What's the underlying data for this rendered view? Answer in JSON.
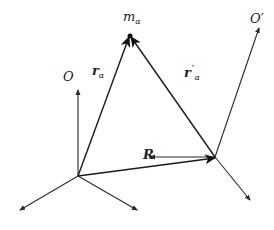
{
  "diagram": {
    "type": "vector-reference-frames",
    "colors": {
      "line": "#2a2a2a",
      "background": "#ffffff"
    },
    "labels": {
      "origin_O": "O",
      "origin_O_prime": "O′",
      "mass": "m",
      "mass_sub": "α",
      "r_alpha": "r",
      "r_alpha_sub": "α",
      "r_prime_alpha": "r",
      "r_prime_alpha_sub": "α",
      "r_prime_mark": "′",
      "R": "R"
    },
    "frames": [
      {
        "name": "O",
        "origin": [
          78,
          176
        ],
        "axes": [
          [
            78,
            89
          ],
          [
            20,
            210
          ],
          [
            137,
            210
          ]
        ]
      },
      {
        "name": "O′",
        "origin": [
          215,
          157
        ],
        "axes": [
          [
            259,
            27
          ],
          [
            149,
            157
          ],
          [
            250,
            200
          ]
        ]
      }
    ],
    "vectors": [
      {
        "name": "R",
        "from": [
          78,
          176
        ],
        "to": [
          215,
          157
        ]
      },
      {
        "name": "r_α",
        "from": [
          78,
          176
        ],
        "to": [
          130,
          36
        ]
      },
      {
        "name": "r′_α",
        "from": [
          215,
          157
        ],
        "to": [
          130,
          36
        ]
      }
    ],
    "particle": {
      "name": "m_α",
      "position": [
        130,
        36
      ]
    }
  }
}
